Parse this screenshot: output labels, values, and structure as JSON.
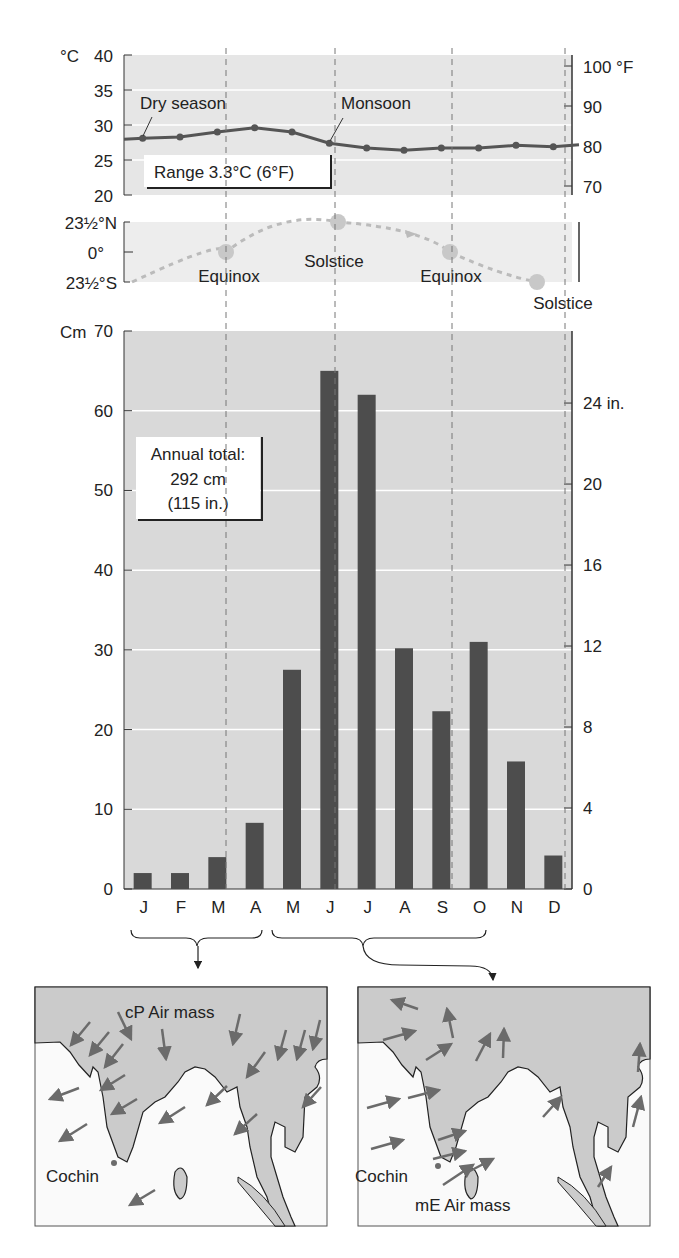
{
  "temperature": {
    "left_unit": "°C",
    "left_ticks": [
      "40",
      "35",
      "30",
      "25",
      "20"
    ],
    "left_values": [
      40,
      35,
      30,
      25,
      20
    ],
    "right_unit": "°F",
    "right_ticks": [
      "100 °F",
      "90",
      "80",
      "70"
    ],
    "annotations": {
      "dry": "Dry season",
      "monsoon": "Monsoon",
      "range": "Range 3.3°C (6°F)"
    }
  },
  "sun": {
    "ticks": [
      "23½°N",
      "0°",
      "23½°S"
    ],
    "labels": [
      "Equinox",
      "Solstice",
      "Equinox",
      "Solstice"
    ]
  },
  "precip": {
    "left_unit": "Cm",
    "left_ticks": [
      "70",
      "60",
      "50",
      "40",
      "30",
      "20",
      "10",
      "0"
    ],
    "right_ticks": [
      "24 in.",
      "20",
      "16",
      "12",
      "8",
      "4",
      "0"
    ],
    "annual_total": {
      "line1": "Annual total:",
      "line2": "292 cm",
      "line3": "(115 in.)"
    }
  },
  "months": [
    "J",
    "F",
    "M",
    "A",
    "M",
    "J",
    "J",
    "A",
    "S",
    "O",
    "N",
    "D"
  ],
  "maps": [
    {
      "air_mass": "cP Air mass",
      "city": "Cochin"
    },
    {
      "air_mass": "mE Air mass",
      "city": "Cochin"
    }
  ],
  "colors": {
    "bar": "#4d4d4d",
    "plot_bg": "#d9d9d9",
    "line": "#555555",
    "land": "#c9c9c9",
    "arrow": "#6b6b6b"
  },
  "chart_data": [
    {
      "type": "line",
      "title": "Monthly mean temperature, Cochin",
      "categories": [
        "J",
        "F",
        "M",
        "A",
        "M",
        "J",
        "J",
        "A",
        "S",
        "O",
        "N",
        "D"
      ],
      "values": [
        28.1,
        28.3,
        29.0,
        29.6,
        29.0,
        27.4,
        26.7,
        26.4,
        26.7,
        26.7,
        27.1,
        26.9
      ],
      "ylabel": "°C",
      "ylim": [
        20,
        40
      ],
      "y2label": "°F",
      "y2ticks": [
        70,
        80,
        90,
        100
      ],
      "annotations": [
        "Dry season",
        "Monsoon",
        "Range 3.3°C (6°F)"
      ],
      "grid": true
    },
    {
      "type": "line",
      "title": "Sun declination",
      "yticks": [
        "23½°S",
        "0°",
        "23½°N"
      ],
      "points": [
        [
          "Dec",
          -23.5
        ],
        [
          "Mar",
          "0 Equinox"
        ],
        [
          "Jun",
          "23.5 Solstice"
        ],
        [
          "Sep",
          "0 Equinox"
        ],
        [
          "Dec",
          "-23.5 Solstice"
        ]
      ]
    },
    {
      "type": "bar",
      "title": "Monthly precipitation, Cochin",
      "categories": [
        "J",
        "F",
        "M",
        "A",
        "M",
        "J",
        "J",
        "A",
        "S",
        "O",
        "N",
        "D"
      ],
      "values": [
        2,
        2,
        4,
        8.3,
        27.5,
        65,
        62,
        30.2,
        22.3,
        31,
        16,
        4.2
      ],
      "ylabel": "Cm",
      "ylim": [
        0,
        70
      ],
      "y2label": "in.",
      "y2ticks": [
        0,
        4,
        8,
        12,
        16,
        20,
        24
      ],
      "annotations": [
        "Annual total: 292 cm (115 in.)"
      ],
      "grid": true
    }
  ]
}
